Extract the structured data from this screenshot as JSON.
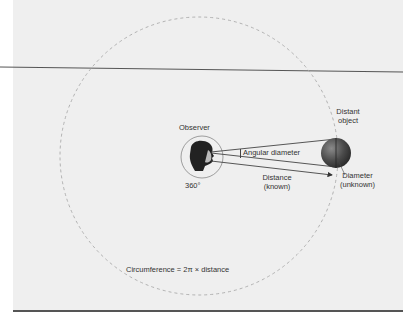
{
  "figure": {
    "labels": {
      "observer": "Observer",
      "full_circle": "360°",
      "angular_diameter": "Angular diameter",
      "distance_line1": "Distance",
      "distance_line2": "(known)",
      "distant_object_line1": "Distant",
      "distant_object_line2": "object",
      "diameter_line1": "Diameter",
      "diameter_line2": "(unknown)",
      "circumference_formula": "Circumference = 2π × distance"
    },
    "colors": {
      "background": "#efefef",
      "page": "#ffffff",
      "line": "#444444",
      "dashed_circle": "#aaaaaa",
      "sphere_light": "#8a8a8a",
      "sphere_dark": "#2a2a2a",
      "border": "#555555"
    }
  }
}
